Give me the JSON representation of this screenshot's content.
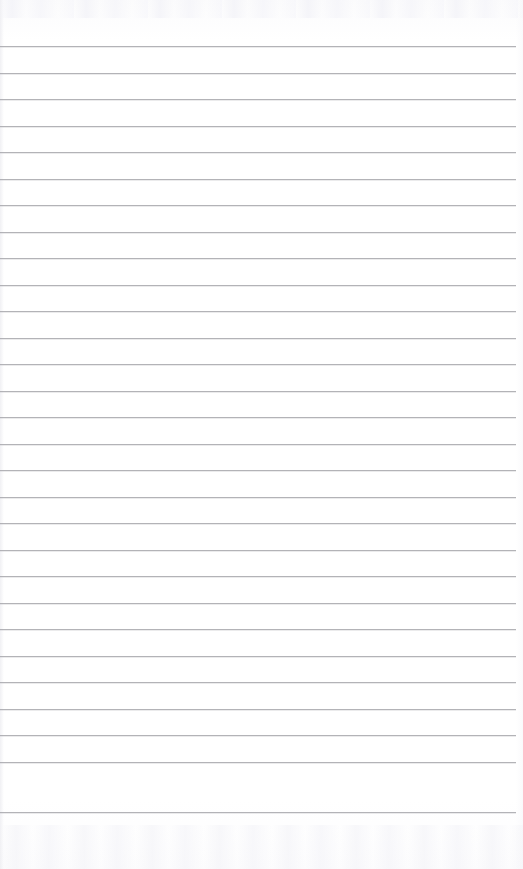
{
  "document": {
    "kind": "scanned-ruled-notebook-page",
    "title": "Blank Ruled Notebook Page",
    "page_width": 523,
    "page_height": 869,
    "background_color": "#fdfdfd",
    "is_blank": true,
    "visible_text": "",
    "header_text": "",
    "footer_text": "",
    "page_number": ""
  },
  "ruling": {
    "line_color": "#a9a9ae",
    "line_thickness_px": 1,
    "line_count": 29,
    "line_spacing_px": 26.5,
    "first_line_y": 46,
    "last_line_y": 812,
    "line_start_x": 0,
    "line_end_x": 516,
    "top_margin_px": 46,
    "bottom_margin_px": 57,
    "left_margin_px": 0,
    "right_margin_px": 7,
    "has_vertical_margin_rule": false,
    "lines": [
      {
        "index": 1,
        "y": 46,
        "x_start": 0,
        "x_end": 516,
        "content": ""
      },
      {
        "index": 2,
        "y": 73,
        "x_start": 0,
        "x_end": 516,
        "content": ""
      },
      {
        "index": 3,
        "y": 99,
        "x_start": 0,
        "x_end": 516,
        "content": ""
      },
      {
        "index": 4,
        "y": 126,
        "x_start": 0,
        "x_end": 516,
        "content": ""
      },
      {
        "index": 5,
        "y": 152,
        "x_start": 0,
        "x_end": 516,
        "content": ""
      },
      {
        "index": 6,
        "y": 179,
        "x_start": 0,
        "x_end": 516,
        "content": ""
      },
      {
        "index": 7,
        "y": 205,
        "x_start": 0,
        "x_end": 516,
        "content": ""
      },
      {
        "index": 8,
        "y": 232,
        "x_start": 0,
        "x_end": 516,
        "content": ""
      },
      {
        "index": 9,
        "y": 258,
        "x_start": 0,
        "x_end": 516,
        "content": ""
      },
      {
        "index": 10,
        "y": 285,
        "x_start": 0,
        "x_end": 516,
        "content": ""
      },
      {
        "index": 11,
        "y": 311,
        "x_start": 0,
        "x_end": 516,
        "content": ""
      },
      {
        "index": 12,
        "y": 338,
        "x_start": 0,
        "x_end": 516,
        "content": ""
      },
      {
        "index": 13,
        "y": 364,
        "x_start": 0,
        "x_end": 516,
        "content": ""
      },
      {
        "index": 14,
        "y": 391,
        "x_start": 0,
        "x_end": 516,
        "content": ""
      },
      {
        "index": 15,
        "y": 417,
        "x_start": 0,
        "x_end": 516,
        "content": ""
      },
      {
        "index": 16,
        "y": 444,
        "x_start": 0,
        "x_end": 516,
        "content": ""
      },
      {
        "index": 17,
        "y": 470,
        "x_start": 0,
        "x_end": 516,
        "content": ""
      },
      {
        "index": 18,
        "y": 497,
        "x_start": 0,
        "x_end": 516,
        "content": ""
      },
      {
        "index": 19,
        "y": 523,
        "x_start": 0,
        "x_end": 516,
        "content": ""
      },
      {
        "index": 20,
        "y": 550,
        "x_start": 0,
        "x_end": 516,
        "content": ""
      },
      {
        "index": 21,
        "y": 576,
        "x_start": 0,
        "x_end": 516,
        "content": ""
      },
      {
        "index": 22,
        "y": 603,
        "x_start": 0,
        "x_end": 516,
        "content": ""
      },
      {
        "index": 23,
        "y": 629,
        "x_start": 0,
        "x_end": 516,
        "content": ""
      },
      {
        "index": 24,
        "y": 656,
        "x_start": 0,
        "x_end": 516,
        "content": ""
      },
      {
        "index": 25,
        "y": 682,
        "x_start": 0,
        "x_end": 516,
        "content": ""
      },
      {
        "index": 26,
        "y": 709,
        "x_start": 0,
        "x_end": 516,
        "content": ""
      },
      {
        "index": 27,
        "y": 735,
        "x_start": 0,
        "x_end": 516,
        "content": ""
      },
      {
        "index": 28,
        "y": 762,
        "x_start": 0,
        "x_end": 516,
        "content": ""
      },
      {
        "index": 29,
        "y": 812,
        "x_start": 0,
        "x_end": 516,
        "content": ""
      }
    ]
  }
}
